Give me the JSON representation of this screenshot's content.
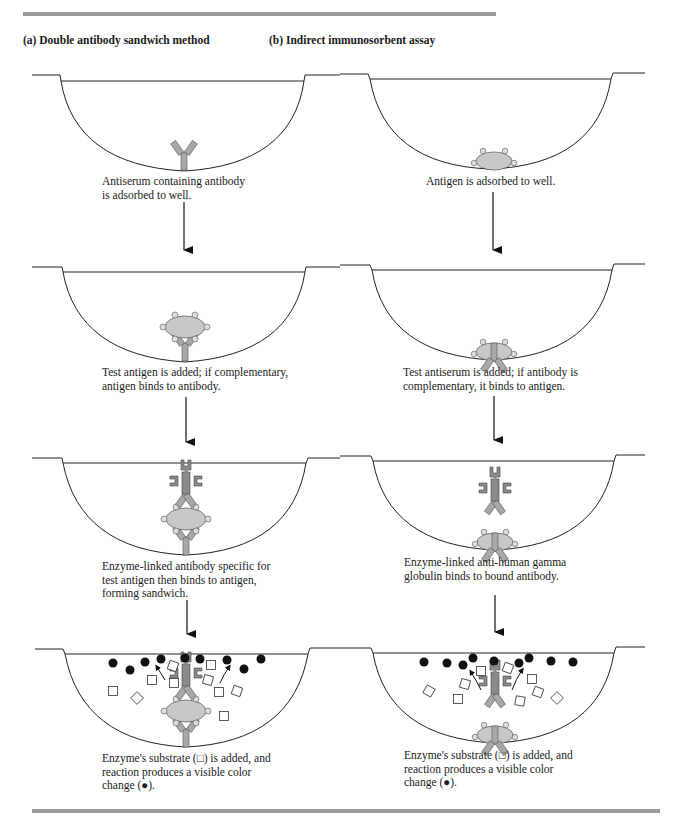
{
  "figure": {
    "columns": [
      {
        "id": "a",
        "heading": "(a)  Double antibody sandwich method",
        "steps": [
          {
            "caption": "Antiserum containing  antibody\nis adsorbed to  well."
          },
          {
            "caption": "Test antigen is added; if  complementary,\nantigen  binds to antibody."
          },
          {
            "caption": "Enzyme-linked antibody  specific for\ntest antigen  then binds to antigen,\nforming sandwich."
          },
          {
            "caption": "Enzyme's substrate (□) is added,  and\nreaction produces a visible  color\nchange (●)."
          }
        ]
      },
      {
        "id": "b",
        "heading": "(b)  Indirect immunosorbent assay",
        "steps": [
          {
            "caption": "Antigen is adsorbed to well."
          },
          {
            "caption": "Test antiserum is added; if  antibody is\ncomplementary,  it binds to antigen."
          },
          {
            "caption": "Enzyme-linked anti-human  gamma\nglobulin binds to bound antibody."
          },
          {
            "caption": "Enzyme's substrate (□) is added,  and\nreaction produces a visible   color\nchange (●)."
          }
        ]
      }
    ],
    "legend_symbols": {
      "substrate": "open-square",
      "color_product": "filled-circle"
    },
    "colors": {
      "rule": "#9a9a9a",
      "antigen_fill": "#c8c8c8",
      "antibody_fill": "#a8a8a8",
      "enzyme_fill": "#8a8a8a",
      "product": "#111111",
      "line": "#222222"
    }
  }
}
